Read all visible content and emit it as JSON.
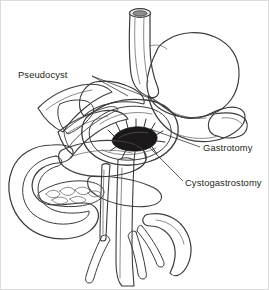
{
  "figure": {
    "width": 269,
    "height": 290,
    "background_color": "#ffffff",
    "border_color": "#d8d8d8"
  },
  "labels": [
    {
      "id": "pseudocyst",
      "text": "Pseudocyst",
      "x": 18,
      "y": 78,
      "anchor": "start",
      "leader": "M 92 76 L 152 99"
    },
    {
      "id": "gastrotomy",
      "text": "Gastrotomy",
      "x": 203,
      "y": 151,
      "anchor": "start",
      "leader": "M 200 147 L 150 129"
    },
    {
      "id": "cystogastrostomy",
      "text": "Cystogastrostomy",
      "x": 185,
      "y": 186,
      "anchor": "start",
      "leader": "M 183 181 L 146 144"
    }
  ],
  "anatomy": {
    "parts": [
      {
        "id": "esophagus",
        "name": "Esophagus",
        "fill": "#e8e8e8",
        "stroke": "#3d3b3c"
      },
      {
        "id": "esophagus-lumen",
        "name": "Esophageal lumen",
        "fill": "#8f8d8e",
        "stroke": "#3d3b3c"
      },
      {
        "id": "stomach-body",
        "name": "Stomach",
        "fill": "#ececec",
        "stroke": "#3d3b3c"
      },
      {
        "id": "stomach-antrum",
        "name": "Gastric antrum",
        "fill": "#e4e4e4",
        "stroke": "#3d3b3c"
      },
      {
        "id": "gastrotomy-window",
        "name": "Anterior gastrotomy",
        "fill": "#cfcfcf",
        "stroke": "#3d3b3c"
      },
      {
        "id": "gastrotomy-rim",
        "name": "Gastrotomy cut edge",
        "fill": "#9e9c9d",
        "stroke": "#3d3b3c"
      },
      {
        "id": "posterior-wall",
        "name": "Posterior gastric wall",
        "fill": "#bcbcbc",
        "stroke": "#3d3b3c"
      },
      {
        "id": "pseudocyst-cavity",
        "name": "Pancreatic pseudocyst",
        "fill": "#6e6c6d",
        "stroke": "#3d3b3c"
      },
      {
        "id": "pseudocyst-flap",
        "name": "Retracted pseudocyst flap",
        "fill": "#f2f2f2",
        "stroke": "#3d3b3c"
      },
      {
        "id": "stoma",
        "name": "Cystogastrostomy stoma",
        "fill": "#1b1819",
        "stroke": "#1b1819"
      },
      {
        "id": "duodenum",
        "name": "Duodenal C-loop",
        "fill": "#e6e6e6",
        "stroke": "#3d3b3c"
      },
      {
        "id": "pancreas-head",
        "name": "Pancreatic head",
        "fill": "#f0f0f0",
        "stroke": "#5a5759"
      },
      {
        "id": "aorta",
        "name": "Aorta",
        "fill": "#a8a6a7",
        "stroke": "#3d3b3c"
      },
      {
        "id": "ivc",
        "name": "Inferior vena cava",
        "fill": "#8a8889",
        "stroke": "#3d3b3c"
      },
      {
        "id": "iliac-vessels",
        "name": "Iliac vessels",
        "fill": "#a8a6a7",
        "stroke": "#3d3b3c"
      }
    ],
    "suture_count": 13
  }
}
